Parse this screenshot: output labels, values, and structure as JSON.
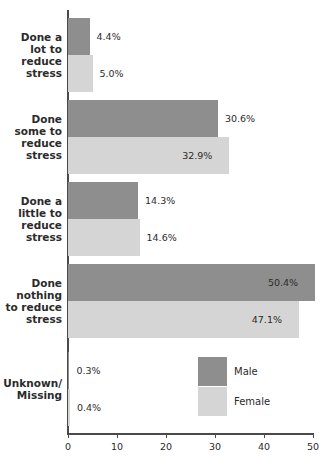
{
  "chart_data": {
    "type": "bar",
    "orientation": "horizontal",
    "title": "",
    "subtitle": "",
    "xlabel": "",
    "ylabel": "",
    "xlim": [
      0,
      50
    ],
    "xticks": [
      0,
      10,
      20,
      30,
      40,
      50
    ],
    "xtick_labels": [
      "0",
      "10",
      "20",
      "30",
      "40",
      "50"
    ],
    "grid": false,
    "legend_position": "inside-lower-right",
    "categories": [
      "Done a lot to reduce stress",
      "Done some to reduce stress",
      "Done a little to reduce stress",
      "Done nothing to reduce stress",
      "Unknown/ Missing"
    ],
    "category_lines": [
      [
        "Done a",
        "lot to",
        "reduce",
        "stress"
      ],
      [
        "Done",
        "some to",
        "reduce",
        "stress"
      ],
      [
        "Done a",
        "little to",
        "reduce",
        "stress"
      ],
      [
        "Done",
        "nothing",
        "to reduce",
        "stress"
      ],
      [
        "Unknown/",
        "Missing"
      ]
    ],
    "series": [
      {
        "name": "Male",
        "color": "#8e8e8e",
        "values": [
          4.4,
          30.6,
          14.3,
          50.4,
          0.3
        ],
        "value_labels": [
          "4.4%",
          "30.6%",
          "14.3%",
          "50.4%",
          "0.3%"
        ]
      },
      {
        "name": "Female",
        "color": "#d5d5d5",
        "values": [
          5.0,
          32.9,
          14.6,
          47.1,
          0.4
        ],
        "value_labels": [
          "5.0%",
          "32.9%",
          "14.6%",
          "47.1%",
          "0.4%"
        ]
      }
    ]
  },
  "legend": {
    "items": [
      {
        "label": "Male",
        "color": "#8e8e8e"
      },
      {
        "label": "Female",
        "color": "#d5d5d5"
      }
    ]
  },
  "axis": {
    "x_tick_labels": [
      "0",
      "10",
      "20",
      "30",
      "40",
      "50"
    ]
  }
}
